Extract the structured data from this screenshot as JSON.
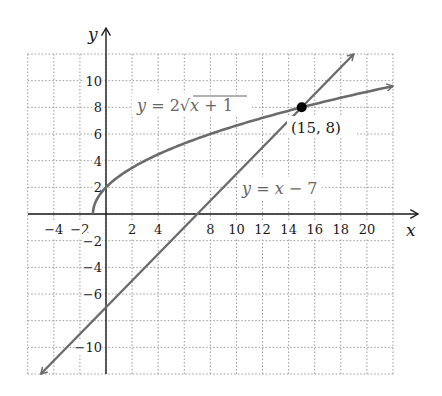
{
  "chart_data": {
    "type": "line",
    "title": "",
    "xlabel": "x",
    "ylabel": "y",
    "xlim": [
      -6,
      22
    ],
    "ylim": [
      -12,
      12
    ],
    "grid": true,
    "grid_step": 2,
    "x_ticks": [
      -4,
      -2,
      2,
      4,
      8,
      10,
      12,
      14,
      16,
      18,
      20
    ],
    "y_ticks": [
      10,
      8,
      6,
      4,
      2,
      -2,
      -4,
      -6,
      -10
    ],
    "series": [
      {
        "name": "y = 2√(x + 1)",
        "equation": "y = 2*sqrt(x+1)",
        "domain": [
          -1,
          22
        ],
        "color": "#6b6b6b",
        "arrow_end": true,
        "x": [
          -1,
          0,
          3,
          8,
          15,
          22
        ],
        "values": [
          0,
          2,
          4,
          6,
          8,
          9.59
        ]
      },
      {
        "name": "y = x − 7",
        "equation": "y = x - 7",
        "domain": [
          -5,
          19
        ],
        "color": "#6b6b6b",
        "arrow_both": true,
        "x": [
          -5,
          7,
          15,
          19
        ],
        "values": [
          -12,
          0,
          8,
          12
        ]
      }
    ],
    "annotations": [
      {
        "type": "point",
        "x": 15,
        "y": 8,
        "label": "(15, 8)",
        "color": "#000000"
      }
    ]
  },
  "labels": {
    "x_axis": "x",
    "y_axis": "y",
    "curve_eq_prefix": "y",
    "curve_eq_mid": " = 2",
    "curve_eq_radicand_x": "x",
    "curve_eq_radicand_rest": " + 1",
    "line_eq_y": "y",
    "line_eq_eq": " = ",
    "line_eq_x": "x",
    "line_eq_rest": " − 7",
    "point": "(15, 8)"
  },
  "colors": {
    "axis": "#1a1a1a",
    "grid": "#9a9a9a",
    "curve": "#6b6b6b",
    "line": "#6b6b6b",
    "point": "#000000"
  }
}
